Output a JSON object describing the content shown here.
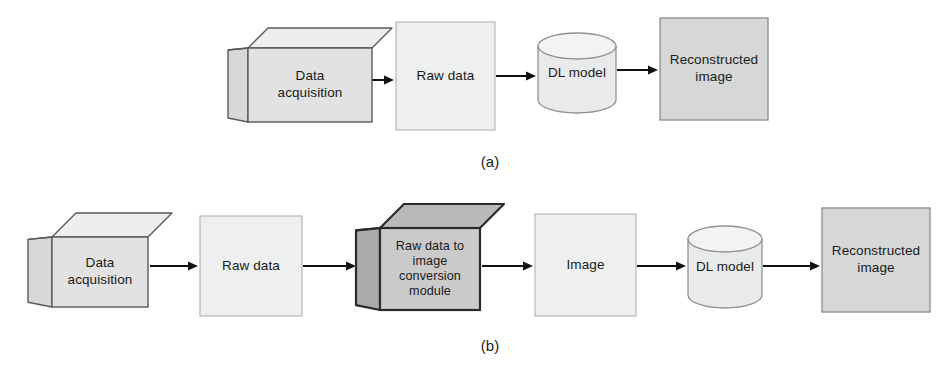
{
  "figure": {
    "background_color": "#ffffff",
    "panels": [
      {
        "id": "panel-a",
        "caption": "(a)",
        "caption_x": 490,
        "caption_y": 167,
        "nodes": [
          {
            "id": "a-data-acquisition",
            "name": "data-acquisition-cube",
            "shape": "cube",
            "lines": [
              "Data",
              "acquisition"
            ],
            "fill": "#e2e2e2",
            "top_fill": "#eeeeee",
            "side_fill": "#d8d8d8",
            "stroke": "#5a5a5a",
            "stroke_width": 1.4,
            "x": 248,
            "y": 48,
            "w": 124,
            "h": 74,
            "depth": 20
          },
          {
            "id": "a-raw-data",
            "name": "raw-data-box",
            "shape": "rect",
            "lines": [
              "Raw data"
            ],
            "fill": "#eef0ef",
            "stroke": "#b6bab8",
            "stroke_width": 1.2,
            "x": 396,
            "y": 22,
            "w": 99,
            "h": 108
          },
          {
            "id": "a-dl-model",
            "name": "dl-model-cylinder",
            "shape": "cylinder",
            "lines": [
              "DL model"
            ],
            "fill": "#e9ebea",
            "top_fill": "#f2f3f3",
            "stroke": "#8e9392",
            "stroke_width": 1.3,
            "x": 538,
            "y": 33,
            "w": 78,
            "h": 80,
            "cap": 13
          },
          {
            "id": "a-reconstructed-image",
            "name": "reconstructed-image-box",
            "shape": "rect",
            "lines": [
              "Reconstructed",
              "image"
            ],
            "fill": "#d6d7d7",
            "stroke": "#8a8c8c",
            "stroke_width": 1.3,
            "x": 660,
            "y": 18,
            "w": 108,
            "h": 102
          }
        ],
        "arrows": [
          {
            "id": "a-arrow-1",
            "name": "arrow-acquisition-to-raw-data",
            "x1": 372,
            "y1": 80,
            "x2": 394,
            "y2": 80
          },
          {
            "id": "a-arrow-2",
            "name": "arrow-raw-data-to-dl-model",
            "x1": 496,
            "y1": 76,
            "x2": 536,
            "y2": 76
          },
          {
            "id": "a-arrow-3",
            "name": "arrow-dl-model-to-reconstructed",
            "x1": 617,
            "y1": 70,
            "x2": 658,
            "y2": 70
          }
        ]
      },
      {
        "id": "panel-b",
        "caption": "(b)",
        "caption_x": 490,
        "caption_y": 351,
        "nodes": [
          {
            "id": "b-data-acquisition",
            "name": "data-acquisition-cube",
            "shape": "cube",
            "lines": [
              "Data",
              "acquisition"
            ],
            "fill": "#e2e2e2",
            "top_fill": "#eeeeee",
            "side_fill": "#d8d8d8",
            "stroke": "#5a5a5a",
            "stroke_width": 1.4,
            "x": 52,
            "y": 237,
            "w": 96,
            "h": 70,
            "depth": 24
          },
          {
            "id": "b-raw-data",
            "name": "raw-data-box",
            "shape": "rect",
            "lines": [
              "Raw data"
            ],
            "fill": "#eef0ef",
            "stroke": "#b6bab8",
            "stroke_width": 1.2,
            "x": 200,
            "y": 216,
            "w": 102,
            "h": 100
          },
          {
            "id": "b-conversion-module",
            "name": "raw-data-to-image-conversion-module-cube",
            "shape": "cube",
            "lines": [
              "Raw data to",
              "image",
              "conversion",
              "module"
            ],
            "fill": "#c9cac9",
            "top_fill": "#b9bab9",
            "side_fill": "#a9aaa9",
            "stroke": "#2a2a2a",
            "stroke_width": 2.2,
            "x": 380,
            "y": 228,
            "w": 100,
            "h": 82,
            "depth": 24
          },
          {
            "id": "b-image",
            "name": "image-box",
            "shape": "rect",
            "lines": [
              "Image"
            ],
            "fill": "#eef0ef",
            "stroke": "#b6bab8",
            "stroke_width": 1.2,
            "x": 535,
            "y": 214,
            "w": 101,
            "h": 102
          },
          {
            "id": "b-dl-model",
            "name": "dl-model-cylinder",
            "shape": "cylinder",
            "lines": [
              "DL model"
            ],
            "fill": "#e9ebea",
            "top_fill": "#f2f3f3",
            "stroke": "#8e9392",
            "stroke_width": 1.3,
            "x": 688,
            "y": 226,
            "w": 74,
            "h": 82,
            "cap": 13
          },
          {
            "id": "b-reconstructed-image",
            "name": "reconstructed-image-box",
            "shape": "rect",
            "lines": [
              "Reconstructed",
              "image"
            ],
            "fill": "#d6d7d7",
            "stroke": "#8a8c8c",
            "stroke_width": 1.3,
            "x": 822,
            "y": 208,
            "w": 108,
            "h": 104
          }
        ],
        "arrows": [
          {
            "id": "b-arrow-1",
            "name": "arrow-acquisition-to-raw-data",
            "x1": 150,
            "y1": 266,
            "x2": 198,
            "y2": 266
          },
          {
            "id": "b-arrow-2",
            "name": "arrow-raw-data-to-conversion",
            "x1": 303,
            "y1": 266,
            "x2": 356,
            "y2": 266
          },
          {
            "id": "b-arrow-3",
            "name": "arrow-conversion-to-image",
            "x1": 482,
            "y1": 266,
            "x2": 533,
            "y2": 266
          },
          {
            "id": "b-arrow-4",
            "name": "arrow-image-to-dl-model",
            "x1": 637,
            "y1": 266,
            "x2": 686,
            "y2": 266
          },
          {
            "id": "b-arrow-5",
            "name": "arrow-dl-model-to-reconstructed",
            "x1": 763,
            "y1": 266,
            "x2": 820,
            "y2": 266
          }
        ]
      }
    ],
    "arrow_style": {
      "color": "#111111",
      "line_width": 2.0,
      "head_length": 10,
      "head_width": 9
    }
  }
}
